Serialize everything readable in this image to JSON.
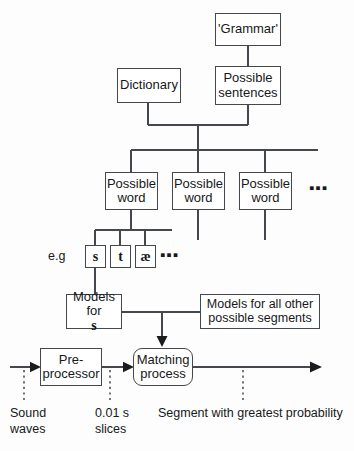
{
  "diagram": {
    "stroke_color": "#44474b",
    "text_color": "#16181a",
    "background": "#fdfdfd"
  },
  "nodes": {
    "grammar": {
      "label": "'Grammar'"
    },
    "dictionary": {
      "label": "Dictionary"
    },
    "possible_sentences": {
      "line1": "Possible",
      "line2": "sentences"
    },
    "possible_words": [
      {
        "line1": "Possible",
        "line2": "word"
      },
      {
        "line1": "Possible",
        "line2": "word"
      },
      {
        "line1": "Possible",
        "line2": "word"
      }
    ],
    "phonemes": [
      {
        "label": "s"
      },
      {
        "label": "t"
      },
      {
        "label": "æ"
      }
    ],
    "models_for_s": {
      "line1": "Models",
      "line2_prefix": "for ",
      "line2_symbol": "s"
    },
    "other_models": {
      "line1": "Models for all other",
      "line2": "possible segments"
    },
    "preprocessor": {
      "line1": "Pre-",
      "line2": "processor"
    },
    "matching_process": {
      "line1": "Matching",
      "line2": "process"
    }
  },
  "labels": {
    "eg": "e.g",
    "ellipsis_words": "▪▪▪",
    "ellipsis_phonemes": "▪▪▪",
    "sound_waves_line1": "Sound",
    "sound_waves_line2": "waves",
    "slices_line1": "0.01 s",
    "slices_line2": "slices",
    "segment_probability": "Segment with greatest probability"
  }
}
